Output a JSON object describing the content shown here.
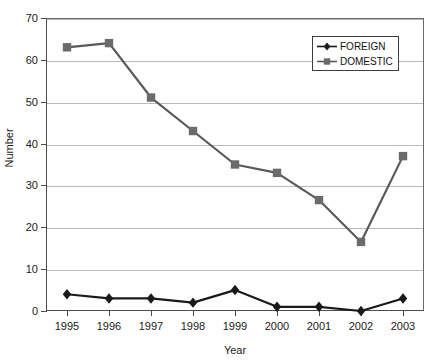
{
  "chart_data": {
    "type": "line",
    "title": "",
    "subtitle": "",
    "xlabel": "Year",
    "ylabel": "Number",
    "categories": [
      "1995",
      "1996",
      "1997",
      "1998",
      "1999",
      "2000",
      "2001",
      "2002",
      "2003"
    ],
    "series": [
      {
        "name": "FOREIGN",
        "marker": "diamond",
        "color": "#1a1a1a",
        "values": [
          4,
          3,
          3,
          2,
          5,
          1,
          1,
          0,
          3
        ]
      },
      {
        "name": "DOMESTIC",
        "marker": "square",
        "color": "#666666",
        "values": [
          63,
          64,
          51,
          43,
          35,
          33,
          26.5,
          16.5,
          37
        ]
      }
    ],
    "ylim": [
      0,
      70
    ],
    "yticks": [
      0,
      10,
      20,
      30,
      40,
      50,
      60,
      70
    ],
    "ytick_labels": [
      "0",
      "10",
      "20",
      "30",
      "40",
      "50",
      "60",
      "70"
    ],
    "grid": "horizontal",
    "legend_position": "top-right",
    "legend_entries": [
      "FOREIGN",
      "DOMESTIC"
    ]
  },
  "axes": {
    "y_title": "Number",
    "x_title": "Year"
  },
  "colors": {
    "foreign_line": "#1a1a1a",
    "domestic_line": "#595959",
    "domestic_marker": "#6b6b6b",
    "gridline": "#b9b9b9",
    "axis": "#4d4d4d",
    "background": "#ffffff"
  }
}
